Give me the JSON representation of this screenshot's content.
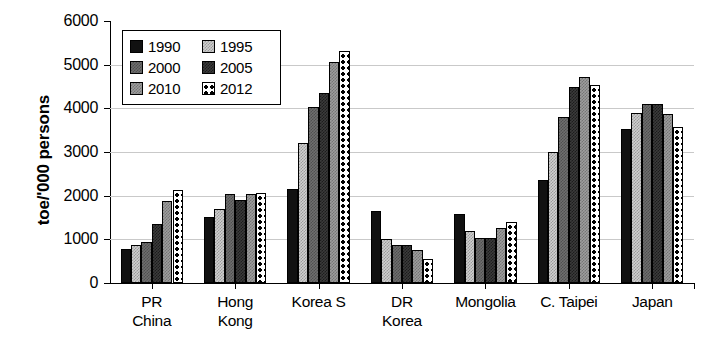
{
  "chart_data": {
    "type": "bar",
    "title": "",
    "xlabel": "",
    "ylabel": "toe/'000 persons",
    "ylim": [
      0,
      6000
    ],
    "ytick_labels": [
      "6000",
      "5000",
      "4000",
      "3000",
      "2000",
      "1000",
      "0"
    ],
    "ytick_values": [
      6000,
      5000,
      4000,
      3000,
      2000,
      1000,
      0
    ],
    "grid": true,
    "legend_position": "upper-left-inside",
    "categories": [
      "PR China",
      "Hong Kong",
      "Korea S",
      "DR Korea",
      "Mongolia",
      "C. Taipei",
      "Japan"
    ],
    "category_lines": [
      [
        "PR",
        "China"
      ],
      [
        "Hong",
        "Kong"
      ],
      [
        "Korea S"
      ],
      [
        "DR",
        "Korea"
      ],
      [
        "Mongolia"
      ],
      [
        "C. Taipei"
      ],
      [
        "Japan"
      ]
    ],
    "series": [
      {
        "name": "1990",
        "color": "#111111",
        "pattern": "solid-black",
        "values": [
          770,
          1520,
          2150,
          1640,
          1570,
          2350,
          3530
        ]
      },
      {
        "name": "1995",
        "color": "#cfcfcf",
        "pattern": "light-gray",
        "values": [
          880,
          1700,
          3200,
          1000,
          1190,
          3000,
          3900
        ]
      },
      {
        "name": "2000",
        "color": "#6e6e6e",
        "pattern": "medium-gray",
        "values": [
          940,
          2030,
          4020,
          870,
          1030,
          3800,
          4090
        ]
      },
      {
        "name": "2005",
        "color": "#3b3b3b",
        "pattern": "dark-gray",
        "values": [
          1350,
          1900,
          4350,
          880,
          1020,
          4500,
          4090
        ]
      },
      {
        "name": "2010",
        "color": "#9d9d9d",
        "pattern": "gray",
        "values": [
          1880,
          2040,
          5060,
          760,
          1270,
          4720,
          3880
        ]
      },
      {
        "name": "2012",
        "color": "#ffffff",
        "pattern": "white-dotted",
        "values": [
          2130,
          2070,
          5320,
          540,
          1390,
          4530,
          3580
        ]
      }
    ]
  },
  "legend": {
    "entries": [
      {
        "label": "1990"
      },
      {
        "label": "1995"
      },
      {
        "label": "2000"
      },
      {
        "label": "2005"
      },
      {
        "label": "2010"
      },
      {
        "label": "2012"
      }
    ]
  }
}
